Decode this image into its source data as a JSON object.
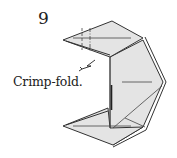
{
  "diagram": {
    "step_number": "9",
    "instruction": "Crimp-fold.",
    "paper_color": "#e4e4e4",
    "line_color": "#333333",
    "symbols": [
      "valley-fold-line",
      "mountain-fold-line",
      "crimp-arrow"
    ]
  }
}
